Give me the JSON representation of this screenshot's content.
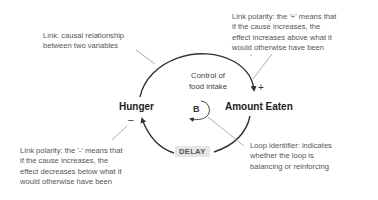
{
  "diagram": {
    "type": "causal-loop-diagram",
    "nodes": {
      "hunger": "Hunger",
      "amount_eaten": "Amount Eaten"
    },
    "loop": {
      "label_line1": "Control of",
      "label_line2": "food intake",
      "identifier": "B"
    },
    "polarities": {
      "positive": "+",
      "negative": "–"
    },
    "delay_label": "DELAY",
    "annotations": {
      "link": {
        "line1": "Link: causal relationship",
        "line2": "between two variables"
      },
      "positive_polarity": {
        "line1": "Link polarity:  the '+' means that",
        "line2": "if the cause increases, the",
        "line3": "effect increases above what it",
        "line4": "would otherwise have been"
      },
      "negative_polarity": {
        "line1": "Link polarity:  the '-' means that",
        "line2": "if the cause increases, the",
        "line3": "effect decreases below what it",
        "line4": "would otherwise have been"
      },
      "loop_identifier": {
        "line1": "Loop identifier: indicates",
        "line2": "whether the loop is",
        "line3": "balancing or reinforcing"
      }
    },
    "colors": {
      "arc": "#333333",
      "leader": "#999999",
      "text": "#555555",
      "delay_bg": "#e6e6e6"
    }
  }
}
